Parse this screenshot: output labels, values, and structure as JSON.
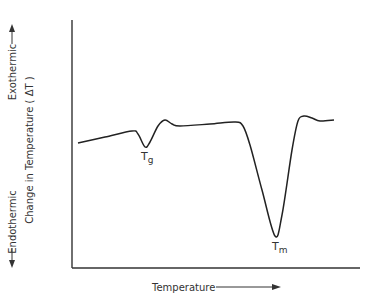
{
  "chart_data": {
    "type": "line",
    "title": "",
    "xlabel": "Temperature",
    "ylabel": "Change in Temperature ( ΔT )",
    "ylabel_upper": "Exothermic",
    "ylabel_lower": "Endothermic",
    "grid": false,
    "ticks": "none",
    "annotations": [
      {
        "text": "Tg",
        "main": "T",
        "sub": "g",
        "description": "glass transition dip"
      },
      {
        "text": "Tm",
        "main": "T",
        "sub": "m",
        "description": "melting endotherm peak"
      }
    ],
    "series": [
      {
        "name": "DTA curve",
        "points_px": [
          [
            78,
            143
          ],
          [
            105,
            137
          ],
          [
            132,
            131
          ],
          [
            138,
            134
          ],
          [
            145,
            147
          ],
          [
            150,
            142
          ],
          [
            158,
            126
          ],
          [
            165,
            120
          ],
          [
            172,
            124
          ],
          [
            180,
            126
          ],
          [
            210,
            124
          ],
          [
            235,
            122
          ],
          [
            243,
            126
          ],
          [
            250,
            145
          ],
          [
            262,
            190
          ],
          [
            275,
            236
          ],
          [
            282,
            215
          ],
          [
            292,
            150
          ],
          [
            298,
            121
          ],
          [
            304,
            116
          ],
          [
            312,
            118
          ],
          [
            320,
            121
          ],
          [
            334,
            120
          ]
        ]
      }
    ]
  },
  "axes": {
    "x_label": "Temperature",
    "y_label": "Change in Temperature ( ΔT )",
    "exo_label": "Exothermic",
    "endo_label": "Endothermic"
  },
  "annotations": {
    "tg_main": "T",
    "tg_sub": "g",
    "tm_main": "T",
    "tm_sub": "m"
  }
}
